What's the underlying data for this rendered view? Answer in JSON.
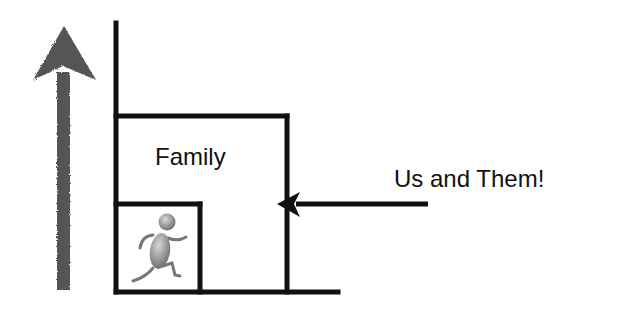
{
  "diagram": {
    "labels": {
      "family": "Family",
      "outside": "Us and Them!"
    },
    "elements": {
      "up_arrow": "large-grey-upward-arrow",
      "nested_boxes": [
        "outer-wall",
        "family-box",
        "inner-self-box"
      ],
      "inward_arrow": "arrow-pointing-into-family-box",
      "figure": "running-person-icon"
    },
    "colors": {
      "lines": "#111111",
      "up_arrow": "#555555",
      "figure": "#8a8a8a",
      "background": "#ffffff"
    }
  }
}
